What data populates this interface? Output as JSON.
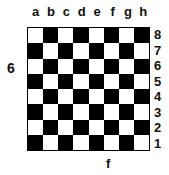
{
  "diagram": {
    "files": [
      "a",
      "b",
      "c",
      "d",
      "e",
      "f",
      "g",
      "h"
    ],
    "ranks": [
      "8",
      "7",
      "6",
      "5",
      "4",
      "3",
      "2",
      "1"
    ],
    "side_label": "6",
    "bottom_label": "f",
    "top_left_square": "light",
    "colors": {
      "light": "#ffffff",
      "dark": "#000000"
    }
  }
}
